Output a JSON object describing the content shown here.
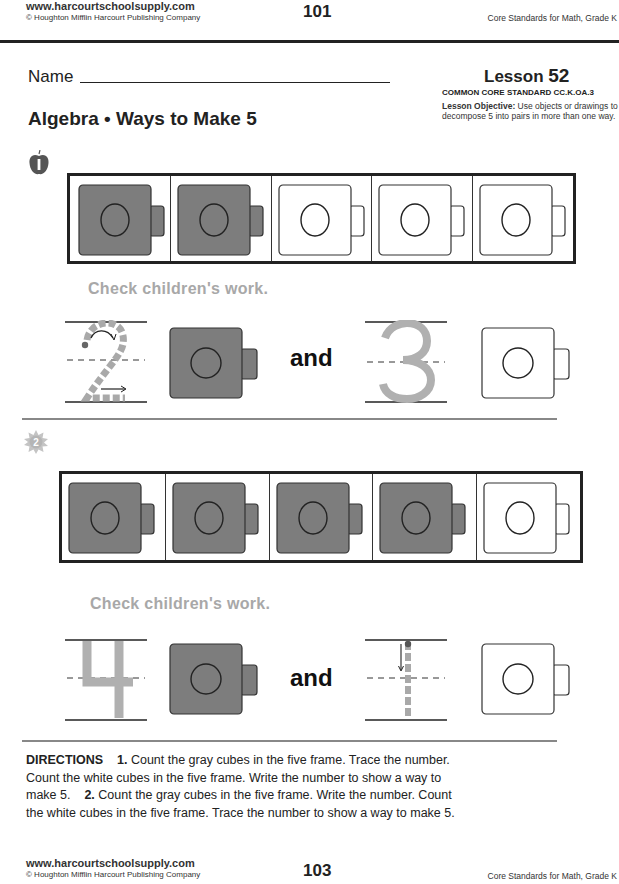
{
  "header": {
    "url": "www.harcourtschoolsupply.com",
    "copyright": "© Houghton Mifflin Harcourt Publishing Company",
    "page_number": "101",
    "right": "Core Standards for Math, Grade K"
  },
  "worksheet": {
    "name_label": "Name",
    "title": "Algebra • Ways to Make 5",
    "lesson_label": "Lesson",
    "lesson_number": "52",
    "standard": "COMMON CORE STANDARD  CC.K.OA.3",
    "objective_label": "Lesson Objective:",
    "objective_text": "Use objects or drawings to decompose 5 into pairs in more than one way."
  },
  "problems": [
    {
      "number": "1",
      "icon": "apple-icon",
      "five_frame": [
        "gray",
        "gray",
        "white",
        "white",
        "white"
      ],
      "check_text": "Check children's work.",
      "first_number": "2",
      "first_style": "trace-dashed",
      "first_cube": "gray",
      "and_label": "and",
      "second_number": "3",
      "second_style": "answer-gray",
      "second_cube": "white"
    },
    {
      "number": "2",
      "icon": "sun-icon",
      "five_frame": [
        "gray",
        "gray",
        "gray",
        "gray",
        "white"
      ],
      "check_text": "Check children's work.",
      "first_number": "4",
      "first_style": "answer-gray",
      "first_cube": "gray",
      "and_label": "and",
      "second_number": "1",
      "second_style": "trace-dashed",
      "second_cube": "white"
    }
  ],
  "directions": {
    "label": "DIRECTIONS",
    "item1_num": "1.",
    "item1_text": "Count the gray cubes in the five frame. Trace the number. Count the white cubes in the five frame. Write the number to show a way to make 5.",
    "item2_num": "2.",
    "item2_text": "Count the gray cubes in the five frame. Write the number. Count the white cubes in the five frame. Trace the number to show a way to make 5."
  },
  "footer": {
    "url": "www.harcourtschoolsupply.com",
    "copyright": "© Houghton Mifflin Harcourt Publishing Company",
    "page_number": "103",
    "right": "Core Standards for Math, Grade K"
  },
  "colors": {
    "cube_gray": "#7d7d7d",
    "answer_gray": "#b0b0b0",
    "check_text": "#a8a8a8"
  }
}
